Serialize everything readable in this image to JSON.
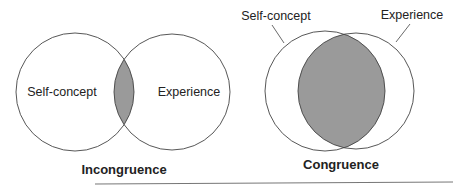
{
  "diagrams": [
    {
      "name": "incongruence",
      "caption": "Incongruence",
      "circles": [
        {
          "label": "Self-concept",
          "cx": 75,
          "cy": 92,
          "r": 59
        },
        {
          "label": "Experience",
          "cx": 172,
          "cy": 92,
          "r": 58
        }
      ],
      "overlap": "small"
    },
    {
      "name": "congruence",
      "caption": "Congruence",
      "circles": [
        {
          "label": "Self-concept",
          "cx": 325,
          "cy": 91,
          "r": 60
        },
        {
          "label": "Experience",
          "cx": 356,
          "cy": 91,
          "r": 58
        }
      ],
      "overlap": "large"
    }
  ],
  "colors": {
    "stroke": "#444444",
    "overlap_fill": "#9a9a9a",
    "background": "#ffffff",
    "rule": "#777777"
  }
}
